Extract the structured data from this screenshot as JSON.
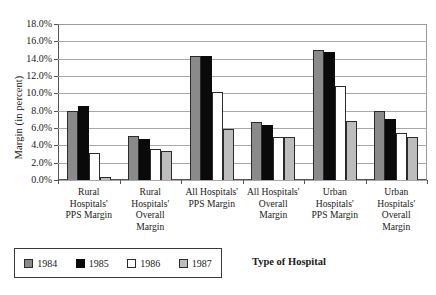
{
  "chart_data": {
    "type": "bar",
    "title": "",
    "xlabel": "Type of Hospital",
    "ylabel": "Margin (in percent)",
    "ylim": [
      0,
      18
    ],
    "ytick_step": 2,
    "ytick_labels": [
      "18.0%",
      "16.0%",
      "14.0%",
      "12.0%",
      "10.0%",
      "8.0%",
      "6.0%",
      "4.0%",
      "2.0%",
      "0.0%"
    ],
    "grid": true,
    "legend_position": "below-left",
    "categories": [
      "Rural Hospitals' PPS Margin",
      "Rural Hospitals' Overall Margin",
      "All Hospitals' PPS Margin",
      "All Hospitals' Overall Margin",
      "Urban Hospitals' PPS Margin",
      "Urban Hospitals' Overall Margin"
    ],
    "category_lines": [
      [
        "Rural",
        "Hospitals'",
        "PPS Margin"
      ],
      [
        "Rural",
        "Hospitals'",
        "Overall",
        "Margin"
      ],
      [
        "All Hospitals'",
        "PPS Margin"
      ],
      [
        "All Hospitals'",
        "Overall",
        "Margin"
      ],
      [
        "Urban",
        "Hospitals'",
        "PPS Margin"
      ],
      [
        "Urban",
        "Hospitals'",
        "Overall",
        "Margin"
      ]
    ],
    "series": [
      {
        "name": "1984",
        "color": "#8a8a8a",
        "values": [
          8.0,
          5.1,
          14.3,
          6.7,
          15.0,
          8.0
        ]
      },
      {
        "name": "1985",
        "color": "#0a0a0a",
        "values": [
          8.5,
          4.7,
          14.3,
          6.4,
          14.8,
          7.0
        ]
      },
      {
        "name": "1986",
        "color": "#ffffff",
        "values": [
          3.1,
          3.6,
          10.2,
          5.0,
          10.8,
          5.4
        ]
      },
      {
        "name": "1987",
        "color": "#bdbdbd",
        "values": [
          0.3,
          3.4,
          5.9,
          5.0,
          6.8,
          5.0
        ]
      }
    ]
  },
  "legend": {
    "items": [
      {
        "label": "1984"
      },
      {
        "label": "1985"
      },
      {
        "label": "1986"
      },
      {
        "label": "1987"
      }
    ]
  },
  "axes": {
    "y_title": "Margin (in percent)",
    "x_title": "Type of Hospital"
  }
}
